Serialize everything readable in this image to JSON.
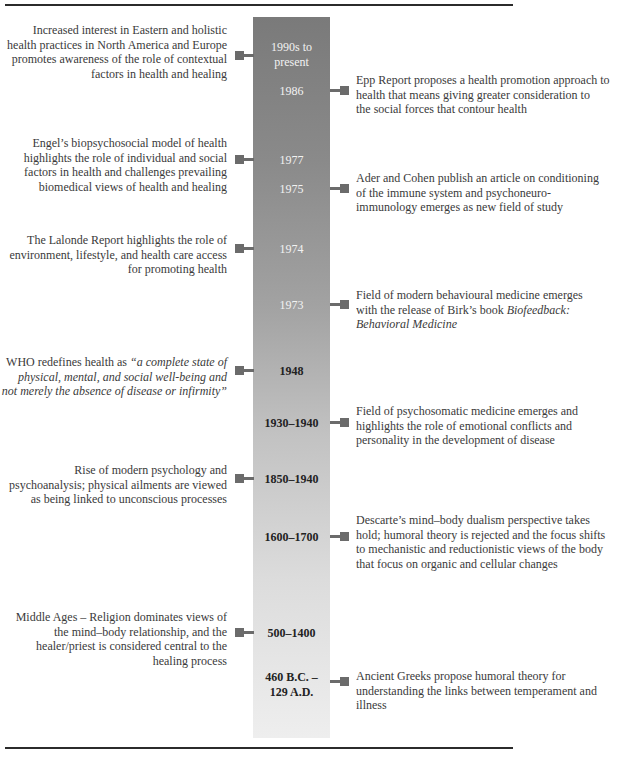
{
  "diagram": {
    "type": "timeline",
    "colors": {
      "bar_top": "#7a7a7a",
      "bar_bottom": "#eeeeee",
      "connector": "#6b6b6b",
      "rule": "#2b2b2b",
      "text": "#3a3a3a"
    },
    "years": [
      {
        "label": "1990s to present"
      },
      {
        "label": "1986"
      },
      {
        "label": "1977"
      },
      {
        "label": "1975"
      },
      {
        "label": "1974"
      },
      {
        "label": "1973"
      },
      {
        "label": "1948"
      },
      {
        "label": "1930–1940"
      },
      {
        "label": "1850–1940"
      },
      {
        "label": "1600–1700"
      },
      {
        "label": "500–1400"
      },
      {
        "label": "460 B.C. – 129 A.D."
      }
    ],
    "left_events": [
      {
        "year": "1990s to present",
        "lines": [
          "Increased interest in Eastern and holistic",
          "health practices in North America and Europe",
          "promotes awareness of the role of contextual",
          "factors in health and healing"
        ]
      },
      {
        "year": "1977",
        "lines": [
          "Engel’s biopsychosocial model of health",
          "highlights the role of individual and social",
          "factors in health and challenges prevailing",
          "biomedical views of health and healing"
        ]
      },
      {
        "year": "1974",
        "lines": [
          "The Lalonde Report highlights the role of",
          "environment, lifestyle, and health care access",
          "for promoting health"
        ]
      },
      {
        "year": "1948",
        "prefix": "WHO redefines health as ",
        "lines": [
          "“a complete state of",
          "physical, mental, and social well-being and",
          "not merely the absence of disease or infirmity”"
        ]
      },
      {
        "year": "1850–1940",
        "lines": [
          "Rise of modern psychology and",
          "psychoanalysis; physical ailments are viewed",
          "as being linked to unconscious processes"
        ]
      },
      {
        "year": "500–1400",
        "lines": [
          "Middle Ages – Religion dominates views of",
          "the mind–body relationship, and the",
          "healer/priest is considered central to the",
          "healing process"
        ]
      }
    ],
    "right_events": [
      {
        "year": "1986",
        "lines": [
          "Epp Report proposes a health promotion approach to",
          "health that means giving greater consideration to",
          "the social forces that contour health"
        ]
      },
      {
        "year": "1975",
        "lines": [
          "Ader and Cohen publish an article on conditioning",
          "of the immune system and psychoneuro-",
          "immunology emerges as new field of study"
        ]
      },
      {
        "year": "1973",
        "line1": "Field of modern behavioural medicine emerges",
        "line2_prefix": "with the release of Birk’s book ",
        "line2_italic": "Biofeedback:",
        "line3_italic": "Behavioral Medicine"
      },
      {
        "year": "1930–1940",
        "lines": [
          "Field of psychosomatic medicine emerges and",
          "highlights the role of emotional conflicts and",
          "personality in the development of disease"
        ]
      },
      {
        "year": "1600–1700",
        "lines": [
          "Descarte’s mind–body dualism perspective takes",
          "hold; humoral theory is rejected and the focus shifts",
          "to mechanistic and reductionistic views of the body",
          "that focus on organic and cellular changes"
        ]
      },
      {
        "year": "460 B.C. – 129 A.D.",
        "lines": [
          "Ancient Greeks propose humoral theory for",
          "understanding the links between temperament and",
          "illness"
        ]
      }
    ]
  }
}
